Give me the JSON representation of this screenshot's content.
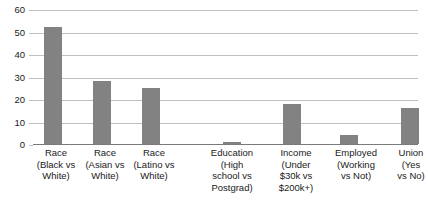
{
  "chart_data": {
    "type": "bar",
    "title": "",
    "subtitle": "",
    "xlabel": "",
    "ylabel": "",
    "ylim": [
      0,
      60
    ],
    "yticks": [
      0,
      10,
      20,
      30,
      40,
      50,
      60
    ],
    "grid": true,
    "legend": false,
    "bar_color": "#828282",
    "gridline_color": "#bfbfbf",
    "axis_color": "#7a7a7a",
    "categories": [
      "Race (Black vs White)",
      "Race (Asian vs White)",
      "Race (Latino vs White)",
      "Education (High school vs Postgrad)",
      "Income (Under $30k vs $200k+)",
      "Employed (Working vs Not)",
      "Union (Yes vs No)"
    ],
    "values": [
      52,
      28,
      25,
      1,
      18,
      4,
      16
    ],
    "category_lines": [
      [
        "Race",
        "(Black vs",
        "White)"
      ],
      [
        "Race",
        "(Asian vs",
        "White)"
      ],
      [
        "Race",
        "(Latino vs",
        "White)"
      ],
      [
        "Education",
        "(High",
        "school vs",
        "Postgrad)"
      ],
      [
        "Income",
        "(Under",
        "$30k vs",
        "$200k+)"
      ],
      [
        "Employed",
        "(Working",
        "vs Not)"
      ],
      [
        "Union",
        "(Yes",
        "vs No)"
      ]
    ]
  },
  "axis": {
    "ytick_0": "0",
    "ytick_10": "10",
    "ytick_20": "20",
    "ytick_30": "30",
    "ytick_40": "40",
    "ytick_50": "50",
    "ytick_60": "60"
  },
  "xlabels": {
    "b0_l0": "Race",
    "b0_l1": "(Black vs",
    "b0_l2": "White)",
    "b0_l3": "",
    "b1_l0": "Race",
    "b1_l1": "(Asian vs",
    "b1_l2": "White)",
    "b1_l3": "",
    "b2_l0": "Race",
    "b2_l1": "(Latino vs",
    "b2_l2": "White)",
    "b2_l3": "",
    "b3_l0": "Education",
    "b3_l1": "(High",
    "b3_l2": "school vs",
    "b3_l3": "Postgrad)",
    "b4_l0": "Income",
    "b4_l1": "(Under",
    "b4_l2": "$30k vs",
    "b4_l3": "$200k+)",
    "b5_l0": "Employed",
    "b5_l1": "(Working",
    "b5_l2": "vs Not)",
    "b5_l3": "",
    "b6_l0": "Union",
    "b6_l1": "(Yes",
    "b6_l2": "vs No)",
    "b6_l3": ""
  }
}
